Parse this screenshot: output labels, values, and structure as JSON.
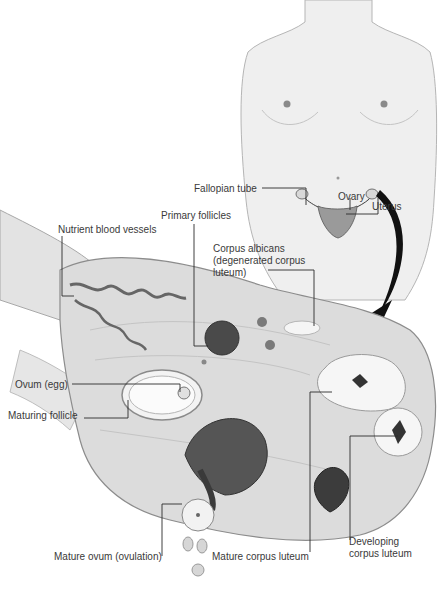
{
  "figure": {
    "colors": {
      "background": "#ffffff",
      "skin_tone": "#ededed",
      "outline": "#9a9a9a",
      "ovary_tissue": "#dcdcdc",
      "follicle_dark": "#3c3c3c",
      "label_text": "#3a3a3a",
      "leader_line": "#2a2a2a",
      "arrow": "#111111"
    }
  },
  "labels": {
    "fallopian_tube": "Fallopian tube",
    "ovary": "Ovary",
    "uterus": "Uterus",
    "primary_follicles": "Primary follicles",
    "nutrient_blood_vessels": "Nutrient blood vessels",
    "corpus_albicans_line1": "Corpus albicans",
    "corpus_albicans_line2": "(degenerated corpus",
    "corpus_albicans_line3": "luteum)",
    "ovum": "Ovum (egg)",
    "maturing_follicle": "Maturing follicle",
    "mature_ovum": "Mature ovum (ovulation)",
    "mature_corpus_luteum": "Mature corpus luteum",
    "developing_corpus_luteum_line1": "Developing",
    "developing_corpus_luteum_line2": "corpus luteum"
  }
}
